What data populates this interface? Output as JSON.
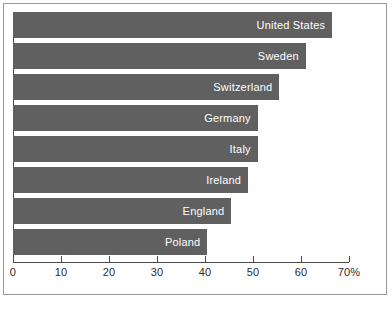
{
  "chart_data": {
    "type": "bar",
    "orientation": "horizontal",
    "title": "",
    "subtitle": "",
    "xlabel": "",
    "ylabel": "",
    "xlim": [
      0,
      70
    ],
    "grid": false,
    "legend": null,
    "axis_unit": "%",
    "tick_labels": [
      "0",
      "10",
      "20",
      "30",
      "40",
      "50",
      "60",
      "70%"
    ],
    "tick_values": [
      0,
      10,
      20,
      30,
      40,
      50,
      60,
      70
    ],
    "categories": [
      "United States",
      "Sweden",
      "Switzerland",
      "Germany",
      "Italy",
      "Ireland",
      "England",
      "Poland"
    ],
    "values": [
      66.5,
      61.0,
      55.5,
      51.0,
      51.0,
      49.0,
      45.5,
      40.5
    ],
    "colors": {
      "bar": "#606060",
      "bar_label": "#ffffff",
      "axis": "#4a4a4a",
      "tick_label": "#2b2b2b",
      "frame": "#9a9a9a",
      "background": "#ffffff"
    }
  }
}
